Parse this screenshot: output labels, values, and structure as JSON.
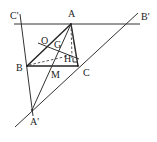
{
  "figure": {
    "type": "geometry-diagram",
    "colors": {
      "stroke": "#333333",
      "background": "#ffffff",
      "text": "#222222"
    },
    "points": {
      "A": {
        "label": "A",
        "x": 71,
        "y": 24
      },
      "B": {
        "label": "B",
        "x": 27,
        "y": 66
      },
      "C": {
        "label": "C",
        "x": 78,
        "y": 66
      },
      "M": {
        "label": "M",
        "x": 52,
        "y": 66
      },
      "O": {
        "label": "O",
        "x": 44,
        "y": 45
      },
      "G": {
        "label": "G",
        "x": 59,
        "y": 50
      },
      "H": {
        "label": "H",
        "x": 72,
        "y": 55
      },
      "A_prime": {
        "label": "A'",
        "x": 32,
        "y": 110
      },
      "B_prime": {
        "label": "B'",
        "x": 130,
        "y": 24
      },
      "C_prime": {
        "label": "C'",
        "x": 21,
        "y": 24
      }
    },
    "labels": {
      "A": "A",
      "B": "B",
      "C": "C",
      "M": "M",
      "O": "O",
      "G": "G",
      "H": "H",
      "A_prime": "A'",
      "B_prime": "B'",
      "C_prime": "C'"
    }
  }
}
